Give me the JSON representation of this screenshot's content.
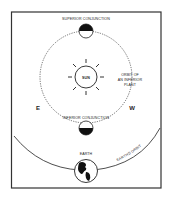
{
  "diagram": {
    "labels": {
      "superior_conjunction": "SUPERIOR CONJUNCTION",
      "inferior_conjunction": "INFERIOR CONJUNCTION",
      "sun": "SUN",
      "orbit_line1": "ORBIT OF",
      "orbit_line2": "AN INFERIOR",
      "orbit_line3": "PLANT",
      "east": "E",
      "west": "W",
      "earth": "EARTH",
      "earths_orbit": "EARTH'S ORBIT"
    },
    "colors": {
      "ink": "#222222",
      "background": "#ffffff",
      "frame": "#333333"
    }
  }
}
